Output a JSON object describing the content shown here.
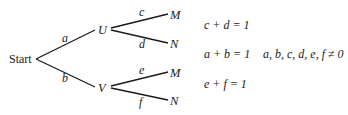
{
  "tree": {
    "root": {
      "label": "Start"
    },
    "level1": [
      {
        "node": "U",
        "edge_label": "a"
      },
      {
        "node": "V",
        "edge_label": "b"
      }
    ],
    "level2": {
      "U": [
        {
          "node": "M",
          "edge_label": "c"
        },
        {
          "node": "N",
          "edge_label": "d"
        }
      ],
      "V": [
        {
          "node": "M",
          "edge_label": "e"
        },
        {
          "node": "N",
          "edge_label": "f"
        }
      ]
    }
  },
  "equations": {
    "cd": "c + d = 1",
    "ab": "a + b = 1",
    "ef": "e + f = 1",
    "constraint": "a, b, c, d, e, f ≠ 0"
  }
}
